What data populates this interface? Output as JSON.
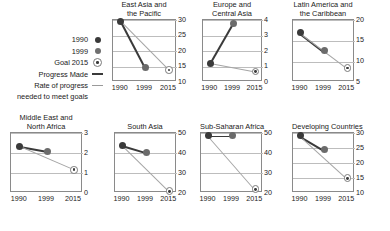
{
  "legend": {
    "rows": [
      {
        "label": "1990",
        "marker": "dot-dark-icon"
      },
      {
        "label": "1999",
        "marker": "dot-gray-icon"
      },
      {
        "label": "Goal 2015",
        "marker": "ring-target-icon"
      },
      {
        "label": "Progress Made",
        "marker": "line-dark-icon"
      },
      {
        "label": "Rate of progress",
        "marker": "line-gray-icon"
      }
    ],
    "continuation": "needed to meet goals"
  },
  "xcategories": [
    "1990",
    "1999",
    "2015"
  ],
  "chart_data": [
    {
      "type": "line",
      "title": "East Asia and the Pacific",
      "title_lines": [
        "East Asia and",
        "the Pacific"
      ],
      "x": [
        "1990",
        "1999",
        "2015"
      ],
      "ylim": [
        10,
        30
      ],
      "yticks": [
        10,
        15,
        20,
        25,
        30
      ],
      "xlabel": "",
      "ylabel": "",
      "grid": true,
      "legend_position": "left-outside",
      "series": [
        {
          "name": "Progress Made",
          "points": [
            [
              "1990",
              29.8
            ],
            [
              "1999",
              14.8
            ]
          ]
        },
        {
          "name": "Rate of progress needed to meet goals",
          "points": [
            [
              "1990",
              29.8
            ],
            [
              "2015",
              14.0
            ]
          ]
        }
      ],
      "markers": [
        {
          "name": "1990",
          "x": "1990",
          "y": 29.8
        },
        {
          "name": "1999",
          "x": "1999",
          "y": 14.8
        },
        {
          "name": "Goal 2015",
          "x": "2015",
          "y": 14.0
        }
      ]
    },
    {
      "type": "line",
      "title": "Europe and Central Asia",
      "title_lines": [
        "Europe and",
        "Central Asia"
      ],
      "x": [
        "1990",
        "1999",
        "2015"
      ],
      "ylim": [
        0,
        4
      ],
      "yticks": [
        0,
        1,
        2,
        3,
        4
      ],
      "xlabel": "",
      "ylabel": "",
      "grid": true,
      "legend_position": "left-outside",
      "series": [
        {
          "name": "Progress Made",
          "points": [
            [
              "1990",
              1.25
            ],
            [
              "1999",
              3.8
            ]
          ]
        },
        {
          "name": "Rate of progress needed to meet goals",
          "points": [
            [
              "1990",
              1.25
            ],
            [
              "2015",
              0.7
            ]
          ]
        }
      ],
      "markers": [
        {
          "name": "1990",
          "x": "1990",
          "y": 1.25
        },
        {
          "name": "1999",
          "x": "1999",
          "y": 3.8
        },
        {
          "name": "Goal 2015",
          "x": "2015",
          "y": 0.7
        }
      ]
    },
    {
      "type": "line",
      "title": "Latin America and the Caribbean",
      "title_lines": [
        "Latin America and",
        "the Caribbean"
      ],
      "x": [
        "1990",
        "1999",
        "2015"
      ],
      "ylim": [
        5,
        20
      ],
      "yticks": [
        5,
        10,
        15,
        20
      ],
      "xlabel": "",
      "ylabel": "",
      "grid": true,
      "legend_position": "left-outside",
      "series": [
        {
          "name": "Progress Made",
          "points": [
            [
              "1990",
              17.0
            ],
            [
              "1999",
              12.6
            ]
          ]
        },
        {
          "name": "Rate of progress needed to meet goals",
          "points": [
            [
              "1990",
              17.0
            ],
            [
              "2015",
              8.5
            ]
          ]
        }
      ],
      "markers": [
        {
          "name": "1990",
          "x": "1990",
          "y": 17.0
        },
        {
          "name": "1999",
          "x": "1999",
          "y": 12.6
        },
        {
          "name": "Goal 2015",
          "x": "2015",
          "y": 8.5
        }
      ]
    },
    {
      "type": "line",
      "title": "Middle East and North Africa",
      "title_lines": [
        "Middle East and",
        "North Africa"
      ],
      "x": [
        "1990",
        "1999",
        "2015"
      ],
      "ylim": [
        0,
        3
      ],
      "yticks": [
        0,
        1,
        2,
        3
      ],
      "xlabel": "",
      "ylabel": "",
      "grid": true,
      "legend_position": "none",
      "series": [
        {
          "name": "Progress Made",
          "points": [
            [
              "1990",
              2.35
            ],
            [
              "1999",
              2.1
            ]
          ]
        },
        {
          "name": "Rate of progress needed to meet goals",
          "points": [
            [
              "1990",
              2.35
            ],
            [
              "2015",
              1.18
            ]
          ]
        }
      ],
      "markers": [
        {
          "name": "1990",
          "x": "1990",
          "y": 2.35
        },
        {
          "name": "1999",
          "x": "1999",
          "y": 2.1
        },
        {
          "name": "Goal 2015",
          "x": "2015",
          "y": 1.18
        }
      ]
    },
    {
      "type": "line",
      "title": "South Asia",
      "title_lines": [
        "South Asia"
      ],
      "x": [
        "1990",
        "1999",
        "2015"
      ],
      "ylim": [
        20,
        50
      ],
      "yticks": [
        20,
        30,
        40,
        50
      ],
      "xlabel": "",
      "ylabel": "",
      "grid": true,
      "legend_position": "none",
      "series": [
        {
          "name": "Progress Made",
          "points": [
            [
              "1990",
              44.0
            ],
            [
              "1999",
              40.5
            ]
          ]
        },
        {
          "name": "Rate of progress needed to meet goals",
          "points": [
            [
              "1990",
              44.0
            ],
            [
              "2015",
              21.0
            ]
          ]
        }
      ],
      "markers": [
        {
          "name": "1990",
          "x": "1990",
          "y": 44.0
        },
        {
          "name": "1999",
          "x": "1999",
          "y": 40.5
        },
        {
          "name": "Goal 2015",
          "x": "2015",
          "y": 21.0
        }
      ]
    },
    {
      "type": "line",
      "title": "Sub-Saharan Africa",
      "title_lines": [
        "Sub-Saharan Africa"
      ],
      "x": [
        "1990",
        "1999",
        "2015"
      ],
      "ylim": [
        20,
        50
      ],
      "yticks": [
        20,
        30,
        40,
        50
      ],
      "xlabel": "",
      "ylabel": "",
      "grid": true,
      "legend_position": "none",
      "series": [
        {
          "name": "Progress Made",
          "points": [
            [
              "1990",
              48.8
            ],
            [
              "1999",
              48.8
            ]
          ]
        },
        {
          "name": "Rate of progress needed to meet goals",
          "points": [
            [
              "1990",
              48.8
            ],
            [
              "2015",
              22.0
            ]
          ]
        }
      ],
      "markers": [
        {
          "name": "1990",
          "x": "1990",
          "y": 48.8
        },
        {
          "name": "1999",
          "x": "1999",
          "y": 48.8
        },
        {
          "name": "Goal 2015",
          "x": "2015",
          "y": 22.0
        }
      ]
    },
    {
      "type": "line",
      "title": "Developing Countries",
      "title_lines": [
        "Developing Countries"
      ],
      "x": [
        "1990",
        "1999",
        "2015"
      ],
      "ylim": [
        10,
        30
      ],
      "yticks": [
        10,
        15,
        20,
        25,
        30
      ],
      "xlabel": "",
      "ylabel": "",
      "grid": true,
      "legend_position": "none",
      "series": [
        {
          "name": "Progress Made",
          "points": [
            [
              "1990",
              29.2
            ],
            [
              "1999",
              24.6
            ]
          ]
        },
        {
          "name": "Rate of progress needed to meet goals",
          "points": [
            [
              "1990",
              29.2
            ],
            [
              "2015",
              15.0
            ]
          ]
        }
      ],
      "markers": [
        {
          "name": "1990",
          "x": "1990",
          "y": 29.2
        },
        {
          "name": "1999",
          "x": "1999",
          "y": 24.6
        },
        {
          "name": "Goal 2015",
          "x": "2015",
          "y": 15.0
        }
      ]
    }
  ],
  "colors": {
    "progress_made": "#3a3a3a",
    "rate_needed": "#a5a5a5",
    "marker_1990": "#3a3a3a",
    "marker_1999": "#6b6b6b",
    "marker_goal_ring": "#7a7a7a",
    "gridline": "#bdbdbd",
    "frame": "#8a8a8a",
    "background": "#ffffff"
  }
}
